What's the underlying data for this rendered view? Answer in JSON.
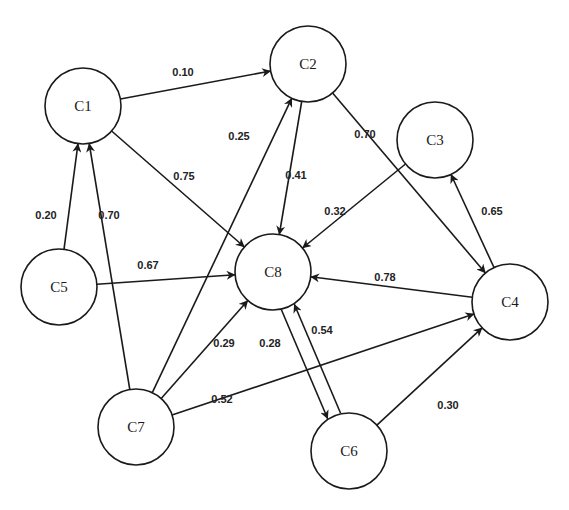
{
  "diagram": {
    "type": "fuzzy-cognitive-map",
    "node_radius": 38,
    "colors": {
      "stroke": "#1a1a1a",
      "label": "#222222",
      "background": "#ffffff"
    },
    "nodes": [
      {
        "id": "C1",
        "label": "C1",
        "x": 83,
        "y": 106
      },
      {
        "id": "C2",
        "label": "C2",
        "x": 308,
        "y": 64
      },
      {
        "id": "C3",
        "label": "C3",
        "x": 435,
        "y": 140
      },
      {
        "id": "C4",
        "label": "C4",
        "x": 510,
        "y": 302
      },
      {
        "id": "C5",
        "label": "C5",
        "x": 59,
        "y": 287
      },
      {
        "id": "C6",
        "label": "C6",
        "x": 349,
        "y": 451
      },
      {
        "id": "C7",
        "label": "C7",
        "x": 136,
        "y": 427
      },
      {
        "id": "C8",
        "label": "C8",
        "x": 273,
        "y": 272
      }
    ],
    "edges": [
      {
        "from": "C1",
        "to": "C2",
        "weight": "0.10",
        "lx": 183,
        "ly": 72
      },
      {
        "from": "C1",
        "to": "C8",
        "weight": "0.75",
        "lx": 184,
        "ly": 176
      },
      {
        "from": "C2",
        "to": "C8",
        "weight": "0.41",
        "lx": 296,
        "ly": 175
      },
      {
        "from": "C2",
        "to": "C4",
        "weight": "0.70",
        "lx": 365,
        "ly": 134
      },
      {
        "from": "C3",
        "to": "C8",
        "weight": "0.32",
        "lx": 335,
        "ly": 211
      },
      {
        "from": "C4",
        "to": "C3",
        "weight": "0.65",
        "lx": 492,
        "ly": 211
      },
      {
        "from": "C4",
        "to": "C8",
        "weight": "0.78",
        "lx": 385,
        "ly": 277
      },
      {
        "from": "C5",
        "to": "C1",
        "weight": "0.20",
        "lx": 46,
        "ly": 215
      },
      {
        "from": "C5",
        "to": "C8",
        "weight": "0.67",
        "lx": 148,
        "ly": 265
      },
      {
        "from": "C7",
        "to": "C1",
        "weight": "0.70",
        "lx": 109,
        "ly": 215
      },
      {
        "from": "C7",
        "to": "C2",
        "weight": "0.25",
        "lx": 239,
        "ly": 136
      },
      {
        "from": "C7",
        "to": "C8",
        "weight": "0.29",
        "lx": 224,
        "ly": 343
      },
      {
        "from": "C7",
        "to": "C4",
        "weight": "0.52",
        "lx": 222,
        "ly": 399
      },
      {
        "from": "C8",
        "to": "C6",
        "weight": "0.54",
        "lx": 322,
        "ly": 330
      },
      {
        "from": "C6",
        "to": "C8",
        "weight": "0.28",
        "lx": 270,
        "ly": 343
      },
      {
        "from": "C6",
        "to": "C4",
        "weight": "0.30",
        "lx": 448,
        "ly": 405
      }
    ]
  }
}
